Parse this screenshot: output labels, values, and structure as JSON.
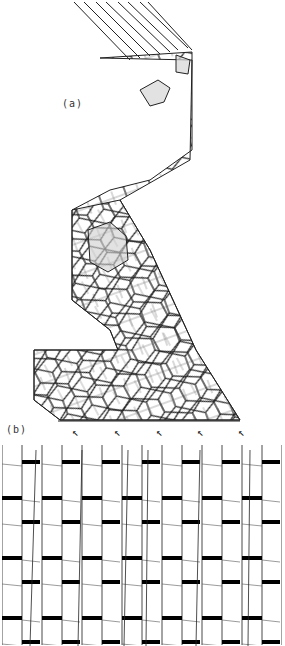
{
  "figure": {
    "panels": [
      {
        "id": "a",
        "label": "(a)",
        "description": "Hexagonal cell network forming a meandering band; some cells shaded grey"
      },
      {
        "id": "b",
        "label": "(b)",
        "description": "Elongated cell files with thick transverse walls"
      }
    ],
    "arrows": [
      {
        "glyph": "↖",
        "x": 74
      },
      {
        "glyph": "↖",
        "x": 116
      },
      {
        "glyph": "↖",
        "x": 158
      },
      {
        "glyph": "↖",
        "x": 199
      },
      {
        "glyph": "↖",
        "x": 240
      }
    ],
    "colors": {
      "line": "#1a1a1a",
      "shade": "#cfcfcf",
      "background": "#ffffff"
    }
  }
}
